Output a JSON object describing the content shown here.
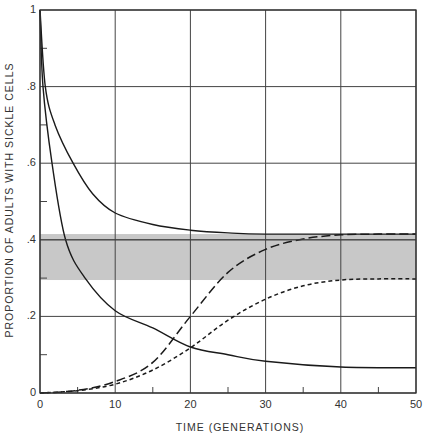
{
  "chart_data": {
    "type": "line",
    "title": "",
    "xlabel": "TIME (GENERATIONS)",
    "ylabel": "PROPORTION OF ADULTS WITH SICKLE CELLS",
    "xlim": [
      0,
      50
    ],
    "ylim": [
      0,
      1
    ],
    "grid": true,
    "x_ticks": [
      0,
      10,
      20,
      30,
      40,
      50
    ],
    "x_tick_labels": [
      "0",
      "10",
      "20",
      "30",
      "40",
      "50"
    ],
    "y_ticks": [
      0,
      0.2,
      0.4,
      0.6,
      0.8,
      1
    ],
    "y_tick_labels": [
      "0",
      ".2",
      ".4",
      ".6",
      ".8",
      "1"
    ],
    "shaded_band": {
      "y_min": 0.295,
      "y_max": 0.415,
      "color": "#c8c8c8"
    },
    "reference_line": {
      "y": 0.4
    },
    "series": [
      {
        "name": "solid-upper",
        "style": "solid",
        "x": [
          0,
          0.7,
          2,
          4.4,
          7,
          10,
          15,
          20,
          25,
          30,
          40,
          50
        ],
        "values": [
          1.0,
          0.8,
          0.7,
          0.6,
          0.52,
          0.47,
          0.44,
          0.425,
          0.418,
          0.415,
          0.415,
          0.415
        ]
      },
      {
        "name": "solid-lower",
        "style": "solid",
        "x": [
          0,
          0.4,
          1.6,
          3.4,
          6,
          10,
          15,
          20,
          25,
          30,
          40,
          50
        ],
        "values": [
          1.0,
          0.8,
          0.6,
          0.4,
          0.3,
          0.215,
          0.17,
          0.12,
          0.1,
          0.083,
          0.068,
          0.066
        ]
      },
      {
        "name": "long-dash",
        "style": "long-dash",
        "x": [
          0,
          5,
          10,
          15,
          20,
          25,
          30,
          35,
          40,
          45,
          50
        ],
        "values": [
          0,
          0.007,
          0.03,
          0.08,
          0.2,
          0.315,
          0.375,
          0.402,
          0.413,
          0.415,
          0.415
        ]
      },
      {
        "name": "short-dash",
        "style": "short-dash",
        "x": [
          0,
          5,
          10,
          15,
          20,
          25,
          30,
          35,
          40,
          45,
          50
        ],
        "values": [
          0,
          0.006,
          0.023,
          0.06,
          0.118,
          0.19,
          0.245,
          0.28,
          0.295,
          0.298,
          0.298
        ]
      }
    ]
  }
}
